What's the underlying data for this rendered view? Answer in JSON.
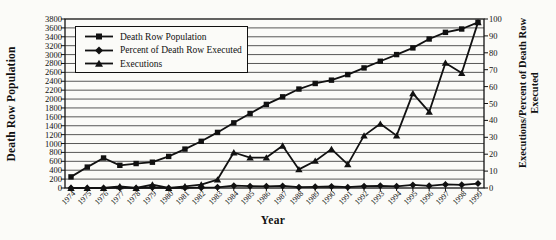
{
  "chart_data": {
    "type": "line",
    "title": "",
    "grid": "horizontal",
    "legend_position": "top-left",
    "colors": {
      "line": "#111111",
      "background": "#fbfbf8"
    },
    "x_axis": {
      "label": "Year",
      "categories": [
        "1974",
        "1975",
        "1976",
        "1977",
        "1978",
        "1979",
        "1980",
        "1981",
        "1982",
        "1983",
        "1984",
        "1985",
        "1986",
        "1987",
        "1988",
        "1989",
        "1990",
        "1991",
        "1992",
        "1993",
        "1994",
        "1995",
        "1996",
        "1997",
        "1998",
        "1999"
      ]
    },
    "y_left": {
      "label": "Death Row Population",
      "min": 0,
      "max": 3800,
      "step": 200,
      "tick_labels": [
        "3800",
        "3600",
        "3400",
        "3200",
        "3000",
        "2800",
        "2600",
        "2400",
        "2200",
        "2000",
        "1800",
        "1600",
        "1400",
        "1200",
        "1000",
        "800",
        "600",
        "400",
        "200",
        "0"
      ]
    },
    "y_right": {
      "label_line1": "Executions/Percent of Death Row",
      "label_line2": "Executed",
      "min": 0,
      "max": 100,
      "step": 10,
      "tick_labels": [
        "100",
        "90",
        "80",
        "70",
        "60",
        "50",
        "40",
        "30",
        "20",
        "10",
        "0"
      ]
    },
    "series": [
      {
        "name": "Death Row Population",
        "marker": "square",
        "axis": "left",
        "values": [
          250,
          470,
          675,
          510,
          550,
          580,
          710,
          875,
          1050,
          1250,
          1465,
          1675,
          1880,
          2050,
          2225,
          2350,
          2425,
          2550,
          2700,
          2850,
          3000,
          3150,
          3350,
          3500,
          3575,
          3725
        ]
      },
      {
        "name": "Percent of Death Row Executed",
        "marker": "diamond",
        "axis": "right",
        "values": [
          0,
          0,
          0,
          0.2,
          0,
          0.3,
          0,
          0.1,
          0.2,
          0.4,
          1.4,
          1.1,
          1.0,
          1.2,
          0.5,
          0.7,
          0.9,
          0.5,
          1.1,
          1.3,
          1.0,
          1.8,
          1.3,
          2.1,
          1.9,
          2.6
        ]
      },
      {
        "name": "Executions",
        "marker": "triangle",
        "axis": "right",
        "values": [
          0,
          0,
          0,
          1,
          0,
          2,
          0,
          1,
          2,
          5,
          21,
          18,
          18,
          25,
          11,
          16,
          23,
          14,
          31,
          38,
          31,
          56,
          45,
          74,
          68,
          98
        ]
      }
    ]
  }
}
